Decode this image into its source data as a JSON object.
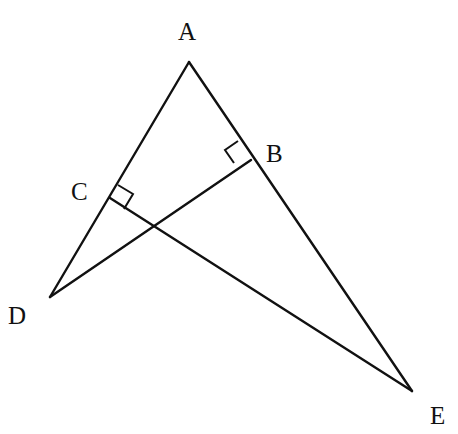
{
  "figure": {
    "type": "geometry",
    "points": {
      "A": {
        "label": "A",
        "x": 189,
        "y": 62,
        "label_x": 178,
        "label_y": 40
      },
      "B": {
        "label": "B",
        "x": 251,
        "y": 160,
        "label_x": 266,
        "label_y": 160
      },
      "C": {
        "label": "C",
        "x": 110,
        "y": 198,
        "label_x": 71,
        "label_y": 198
      },
      "D": {
        "label": "D",
        "x": 50,
        "y": 297,
        "label_x": 8,
        "label_y": 324
      },
      "E": {
        "label": "E",
        "x": 412,
        "y": 391,
        "label_x": 430,
        "label_y": 424
      }
    },
    "segments": [
      {
        "from": "A",
        "to": "D"
      },
      {
        "from": "A",
        "to": "E"
      },
      {
        "from": "D",
        "to": "B"
      },
      {
        "from": "C",
        "to": "E"
      }
    ],
    "right_angles": [
      {
        "at": "B",
        "between": [
          "A",
          "D"
        ]
      },
      {
        "at": "C",
        "between": [
          "A",
          "E"
        ]
      }
    ]
  }
}
